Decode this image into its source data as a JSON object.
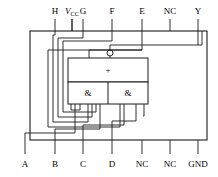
{
  "figure": {
    "type": "logic-ic-pinout-schematic",
    "line_color": "#1a1a1a",
    "background": "#ffffff"
  },
  "package": {
    "outline": {
      "x": 30,
      "y": 31,
      "width": 177,
      "height": 109
    }
  },
  "top_pins": [
    {
      "name": "pin-vcc",
      "label": "V",
      "subscript": "CC",
      "italic_main": true,
      "x": 25
    },
    {
      "name": "pin-h",
      "label": "H",
      "subscript": "",
      "italic_main": false,
      "x": 55
    },
    {
      "name": "pin-g",
      "label": "G",
      "subscript": "",
      "italic_main": false,
      "x": 83
    },
    {
      "name": "pin-f",
      "label": "F",
      "subscript": "",
      "italic_main": false,
      "x": 112
    },
    {
      "name": "pin-e",
      "label": "E",
      "subscript": "",
      "italic_main": false,
      "x": 142
    },
    {
      "name": "pin-nc-top",
      "label": "NC",
      "subscript": "",
      "italic_main": false,
      "x": 170
    },
    {
      "name": "pin-y",
      "label": "Y",
      "subscript": "",
      "italic_main": false,
      "x": 198
    }
  ],
  "bottom_pins": [
    {
      "name": "pin-a",
      "label": "A",
      "x": 25
    },
    {
      "name": "pin-b",
      "label": "B",
      "x": 55
    },
    {
      "name": "pin-c",
      "label": "C",
      "x": 83
    },
    {
      "name": "pin-d",
      "label": "D",
      "x": 112
    },
    {
      "name": "pin-nc-bottom-1",
      "label": "NC",
      "x": 142
    },
    {
      "name": "pin-nc-bottom-2",
      "label": "NC",
      "x": 170
    },
    {
      "name": "pin-gnd",
      "label": "GND",
      "x": 198
    }
  ],
  "gates": {
    "or_gate": {
      "symbol": "+",
      "x": 108,
      "y": 70,
      "box": {
        "x": 68,
        "y": 58,
        "width": 80,
        "height": 24
      }
    },
    "and_gate_left": {
      "symbol": "&",
      "x": 88,
      "y": 93,
      "width": 40
    },
    "and_gate_right": {
      "symbol": "&",
      "x": 128,
      "y": 93,
      "width": 40
    },
    "invert_bubble": {
      "cx": 110,
      "cy": 53,
      "r": 3
    },
    "block": {
      "x": 68,
      "y": 58,
      "width": 80,
      "height": 46
    }
  }
}
